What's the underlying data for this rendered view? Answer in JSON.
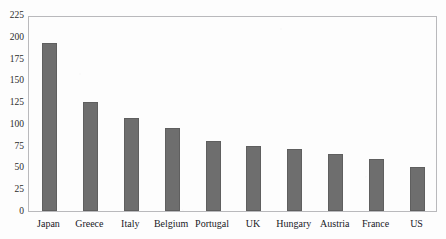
{
  "chart_data": {
    "type": "bar",
    "title": "",
    "xlabel": "",
    "ylabel": "",
    "categories": [
      "Japan",
      "Greece",
      "Italy",
      "Belgium",
      "Portugal",
      "UK",
      "Hungary",
      "Austria",
      "France",
      "US"
    ],
    "values": [
      193,
      125,
      107,
      95,
      80,
      75,
      71,
      65,
      60,
      50
    ],
    "ylim": [
      0,
      225
    ],
    "ytick_values": [
      0,
      25,
      50,
      75,
      100,
      125,
      150,
      175,
      200,
      225
    ],
    "ytick_labels": [
      "0",
      "25",
      "50",
      "75",
      "100",
      "125",
      "150",
      "175",
      "200",
      "225"
    ],
    "grid": false,
    "legend": null,
    "bar_color": "#6e6e6e",
    "frame_color": "#b9b9bc",
    "background_color": "#fdfdfd"
  },
  "figure": {
    "cropped_title_text": "Gross Public Debt as % of GDP"
  }
}
